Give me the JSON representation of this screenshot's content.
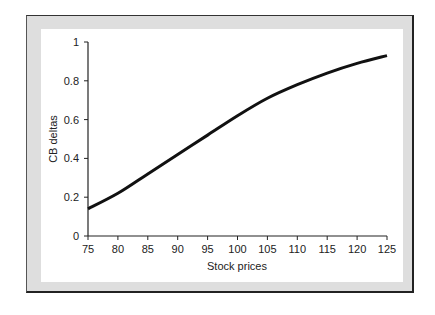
{
  "chart_data": {
    "type": "line",
    "title": "",
    "xlabel": "Stock prices",
    "ylabel": "CB deltas",
    "xlim": [
      75,
      125
    ],
    "ylim": [
      0,
      1
    ],
    "grid": false,
    "legend": null,
    "x_ticks": [
      "75",
      "80",
      "85",
      "90",
      "95",
      "100",
      "105",
      "110",
      "115",
      "120",
      "125"
    ],
    "y_ticks": [
      "0",
      "0.2",
      "0.4",
      "0.6",
      "0.8",
      "1"
    ],
    "series": [
      {
        "name": "CB delta",
        "color": "#111111",
        "x": [
          75,
          80,
          85,
          90,
          95,
          100,
          105,
          110,
          115,
          120,
          125
        ],
        "y": [
          0.14,
          0.22,
          0.32,
          0.42,
          0.52,
          0.62,
          0.71,
          0.78,
          0.84,
          0.89,
          0.93
        ]
      }
    ]
  },
  "labels": {
    "xlabel": "Stock prices",
    "ylabel": "CB deltas"
  }
}
